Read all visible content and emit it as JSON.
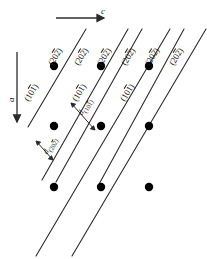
{
  "figure": {
    "background_color": "#ffffff",
    "line_color": "#2b2b2b",
    "dot_color": "#000000",
    "width": 207,
    "height": 259
  },
  "axes": {
    "horizontal": {
      "label": "c",
      "direction": "right",
      "arrow_name": "c-axis-arrow"
    },
    "vertical": {
      "label": "a",
      "direction": "down",
      "arrow_name": "a-axis-arrow"
    }
  },
  "plane_labels_202": [
    {
      "prefix": "(20",
      "bar": "2",
      "suffix": ")"
    },
    {
      "prefix": "(20",
      "bar": "2",
      "suffix": ")"
    },
    {
      "prefix": "(20",
      "bar": "2",
      "suffix": ")"
    },
    {
      "prefix": "(20",
      "bar": "2",
      "suffix": ")"
    },
    {
      "prefix": "(20",
      "bar": "2",
      "suffix": ")"
    },
    {
      "prefix": "(20",
      "bar": "2",
      "suffix": ")"
    }
  ],
  "plane_labels_101": [
    {
      "prefix": "(10",
      "bar": "1",
      "suffix": ")"
    },
    {
      "prefix": "(10",
      "bar": "1",
      "suffix": ")"
    },
    {
      "prefix": "(10",
      "bar": "1",
      "suffix": ")"
    }
  ],
  "spacing_labels": {
    "d101": {
      "symbol": "d",
      "sub_prefix": "(10",
      "sub_bar": "1",
      "sub_suffix": ")"
    },
    "d202": {
      "symbol": "d",
      "sub_prefix": "(20",
      "sub_bar": "2",
      "sub_suffix": ")"
    }
  },
  "lattice_points": {
    "count": 9,
    "rows": [
      {
        "row": "top",
        "count": 3
      },
      {
        "row": "middle",
        "count": 3
      },
      {
        "row": "bottom",
        "count": 3
      }
    ]
  }
}
